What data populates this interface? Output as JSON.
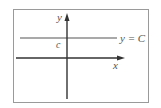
{
  "diagram": {
    "axes": {
      "x_label": "x",
      "y_label": "y"
    },
    "line": {
      "label": "y = C",
      "intercept_label": "c",
      "type": "horizontal"
    },
    "colors": {
      "frame": "#9a9a9a",
      "axis": "#333333",
      "line": "#555555",
      "text": "#555555"
    }
  }
}
